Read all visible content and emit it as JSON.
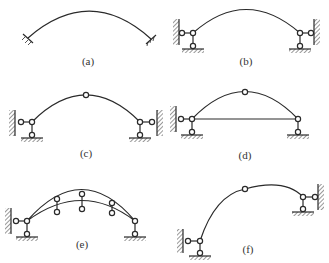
{
  "figure": {
    "panels": [
      {
        "id": "a",
        "label": "(a)",
        "type": "hingeless arch (fixed both ends)"
      },
      {
        "id": "b",
        "label": "(b)",
        "type": "two-hinged arch"
      },
      {
        "id": "c",
        "label": "(c)",
        "type": "three-hinged arch"
      },
      {
        "id": "d",
        "label": "(d)",
        "type": "tied three-hinged arch"
      },
      {
        "id": "e",
        "label": "(e)",
        "type": "trussed three-hinged arch"
      },
      {
        "id": "f",
        "label": "(f)",
        "type": "asymmetric three-hinged arch"
      }
    ]
  },
  "colors": {
    "line": "#2a2a2a",
    "background": "#ffffff"
  }
}
